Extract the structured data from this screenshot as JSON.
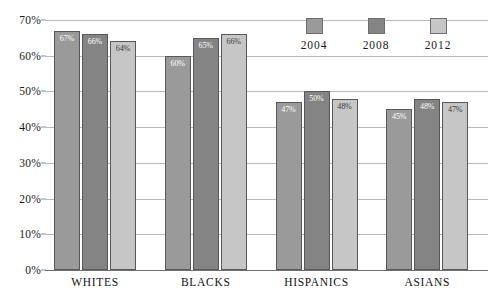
{
  "chart_data": {
    "type": "bar",
    "title": "",
    "subtitle": "",
    "xlabel": "",
    "ylabel": "",
    "categories": [
      "WHITES",
      "BLACKS",
      "HISPANICS",
      "ASIANS"
    ],
    "series": [
      {
        "name": "2004",
        "color": "#9a9a9a",
        "values": [
          67,
          66,
          47,
          45
        ]
      },
      {
        "name": "2008",
        "color": "#848484",
        "values": [
          60,
          65,
          50,
          48
        ]
      },
      {
        "name": "2012",
        "color": "#c6c6c6",
        "values": [
          64,
          66,
          48,
          47
        ]
      }
    ],
    "value_labels": [
      [
        "67%",
        "66%",
        "64%"
      ],
      [
        "60%",
        "65%",
        "66%"
      ],
      [
        "47%",
        "50%",
        "48%"
      ],
      [
        "45%",
        "48%",
        "47%"
      ]
    ],
    "ylim": [
      0,
      70
    ],
    "ytick_step": 10,
    "ytick_labels": [
      "0%",
      "10%",
      "20%",
      "30%",
      "40%",
      "50%",
      "60%",
      "70%"
    ],
    "ytick_values": [
      0,
      10,
      20,
      30,
      40,
      50,
      60,
      70
    ],
    "grid": true,
    "grid_axis": "y",
    "legend_position": "top-right",
    "legend_entries": [
      "2004",
      "2008",
      "2012"
    ]
  },
  "axis": {
    "y_labels": [
      "70%",
      "60%",
      "50%",
      "40%",
      "30%",
      "20%",
      "10%",
      "0%"
    ]
  },
  "legend": {
    "items": [
      {
        "label": "2004"
      },
      {
        "label": "2008"
      },
      {
        "label": "2012"
      }
    ]
  },
  "groups": [
    {
      "category": "WHITES",
      "bars": [
        {
          "series": "2004",
          "value": 67,
          "label": "67%"
        },
        {
          "series": "2008",
          "value": 66,
          "label": "66%"
        },
        {
          "series": "2012",
          "value": 64,
          "label": "64%"
        }
      ]
    },
    {
      "category": "BLACKS",
      "bars": [
        {
          "series": "2004",
          "value": 60,
          "label": "60%"
        },
        {
          "series": "2008",
          "value": 65,
          "label": "65%"
        },
        {
          "series": "2012",
          "value": 66,
          "label": "66%"
        }
      ]
    },
    {
      "category": "HISPANICS",
      "bars": [
        {
          "series": "2004",
          "value": 47,
          "label": "47%"
        },
        {
          "series": "2008",
          "value": 50,
          "label": "50%"
        },
        {
          "series": "2012",
          "value": 48,
          "label": "48%"
        }
      ]
    },
    {
      "category": "ASIANS",
      "bars": [
        {
          "series": "2004",
          "value": 45,
          "label": "45%"
        },
        {
          "series": "2008",
          "value": 48,
          "label": "48%"
        },
        {
          "series": "2012",
          "value": 47,
          "label": "47%"
        }
      ]
    }
  ]
}
